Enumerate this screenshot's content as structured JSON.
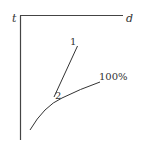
{
  "diagram": {
    "axes": {
      "vertical_label": "t",
      "horizontal_label": "d",
      "color": "#444444"
    },
    "lines": [
      {
        "label": "1",
        "kind": "straight line"
      },
      {
        "label": "2",
        "kind": "intersection label"
      }
    ],
    "curve": {
      "label": "100%"
    },
    "stroke_color": "#333333"
  }
}
